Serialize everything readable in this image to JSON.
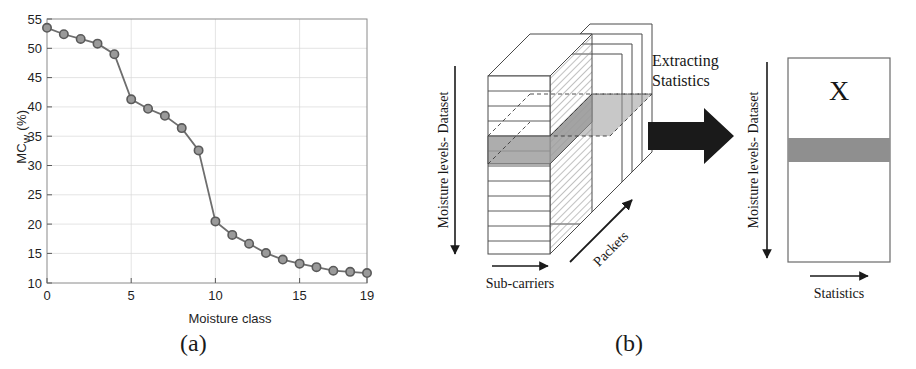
{
  "figure": {
    "caption_a": "(a)",
    "caption_b": "(b)"
  },
  "chart_data": {
    "type": "line",
    "title": "",
    "xlabel": "Moisture class",
    "ylabel": "MC_W (%)",
    "ylabel_main": "MC",
    "ylabel_sub": "W",
    "ylabel_unit": " (%)",
    "xlim": [
      0,
      19
    ],
    "ylim": [
      10,
      55
    ],
    "xticks": [
      0,
      5,
      10,
      15,
      19
    ],
    "xticklabels": [
      "0",
      "5",
      "10",
      "15",
      "19"
    ],
    "yticks": [
      10,
      15,
      20,
      25,
      30,
      35,
      40,
      45,
      50,
      55
    ],
    "yticklabels": [
      "10",
      "15",
      "20",
      "25",
      "30",
      "35",
      "40",
      "45",
      "50",
      "55"
    ],
    "grid": true,
    "legend": "none",
    "marker": "circle",
    "line_color": "#6e6e6e",
    "marker_face_color": "#9a9a9a",
    "marker_edge_color": "#5a5a5a",
    "x": [
      0,
      1,
      2,
      3,
      4,
      5,
      6,
      7,
      8,
      9,
      10,
      11,
      12,
      13,
      14,
      15,
      16,
      17,
      18,
      19
    ],
    "values": [
      53.5,
      52.4,
      51.6,
      50.8,
      49.0,
      41.3,
      39.7,
      38.5,
      36.4,
      32.6,
      20.5,
      18.2,
      16.7,
      15.1,
      14.0,
      13.3,
      12.7,
      12.1,
      11.9,
      11.7
    ],
    "categories": [
      "0",
      "1",
      "2",
      "3",
      "4",
      "5",
      "6",
      "7",
      "8",
      "9",
      "10",
      "11",
      "12",
      "13",
      "14",
      "15",
      "16",
      "17",
      "18",
      "19"
    ]
  },
  "diagram": {
    "cube": {
      "axis_vertical_label": "Moisture levels- Dataset",
      "axis_horizontal_label": "Sub-carriers",
      "axis_depth_label": "Packets",
      "layer_count": 12,
      "highlight_color": "#9b9b9b"
    },
    "arrow": {
      "label_line1": "Extracting",
      "label_line2": "Statistics",
      "color": "#1a1a1a"
    },
    "matrix": {
      "symbol": "X",
      "axis_vertical_label": "Moisture levels- Dataset",
      "axis_horizontal_label": "Statistics",
      "highlight_color": "#8f8f8f",
      "border_color": "#6a6a6a"
    }
  }
}
